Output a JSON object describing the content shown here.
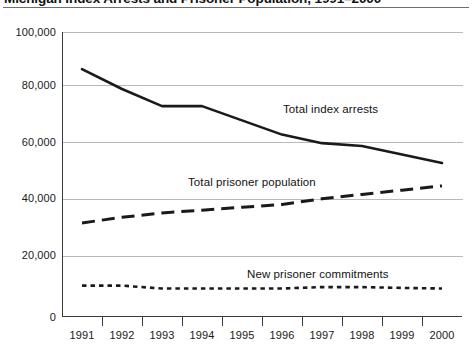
{
  "chart_data": {
    "type": "line",
    "title": "Michigan Index Arrests and Prisoner Population, 1991–2000",
    "xlabel": "",
    "ylabel": "",
    "x": [
      1991,
      1992,
      1993,
      1994,
      1995,
      1996,
      1997,
      1998,
      1999,
      2000
    ],
    "categories": [
      "1991",
      "1992",
      "1993",
      "1994",
      "1995",
      "1996",
      "1997",
      "1998",
      "1999",
      "2000"
    ],
    "ylim": [
      0,
      100000
    ],
    "xlim": [
      1991,
      2000
    ],
    "yticks": [
      0,
      20000,
      40000,
      60000,
      80000,
      100000
    ],
    "ytick_labels": [
      "0",
      "20,000",
      "40,000",
      "60,000",
      "80,000",
      "100,000"
    ],
    "grid": "horizontal",
    "legend_position": "inline-annotations",
    "series": [
      {
        "name": "Total index arrests",
        "style": "solid",
        "color": "#1a1a1a",
        "values": [
          87000,
          80000,
          74000,
          74000,
          69000,
          64000,
          61000,
          60000,
          57000,
          54000
        ]
      },
      {
        "name": "Total prisoner population",
        "style": "dash-dot",
        "color": "#1a1a1a",
        "values": [
          33000,
          35000,
          36500,
          37500,
          38500,
          39500,
          41500,
          43000,
          44500,
          46000
        ]
      },
      {
        "name": "New prisoner commitments",
        "style": "dotted",
        "color": "#1a1a1a",
        "values": [
          11000,
          11000,
          10000,
          10000,
          10000,
          10000,
          10500,
          10500,
          10200,
          10000
        ]
      }
    ],
    "annotations": [
      {
        "text": "Total index arrests",
        "x": 1996,
        "y": 68000
      },
      {
        "text": "Total prisoner population",
        "x": 1994,
        "y": 46000
      },
      {
        "text": "New prisoner commitments",
        "x": 1996,
        "y": 17000
      }
    ]
  }
}
